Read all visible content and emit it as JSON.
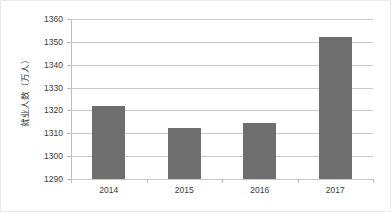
{
  "chart_data": {
    "type": "bar",
    "title": "",
    "subtitle": "",
    "xlabel": "",
    "ylabel": "就业人数（万人）",
    "categories": [
      "2014",
      "2015",
      "2016",
      "2017"
    ],
    "values": [
      1322,
      1312.5,
      1314.5,
      1352
    ],
    "series": [
      {
        "name": "就业人数",
        "values": [
          1322,
          1312.5,
          1314.5,
          1352
        ]
      }
    ],
    "ylim": [
      1290,
      1360
    ],
    "ytick_labels": [
      "1290",
      "1300",
      "1310",
      "1320",
      "1330",
      "1340",
      "1350",
      "1360"
    ],
    "ytick_values": [
      1290,
      1300,
      1310,
      1320,
      1330,
      1340,
      1350,
      1360
    ],
    "ytick_step": 10,
    "grid": true,
    "grid_axis": "y",
    "legend": false,
    "legend_position": "none",
    "annotations": [],
    "colors": {
      "bar": "#6E6E6E",
      "gridline": "#C8C8C8",
      "axis": "#BDBDBD",
      "text": "#3B3B3B",
      "background": "#FFFFFF",
      "frame": "#E9E9E9"
    }
  }
}
